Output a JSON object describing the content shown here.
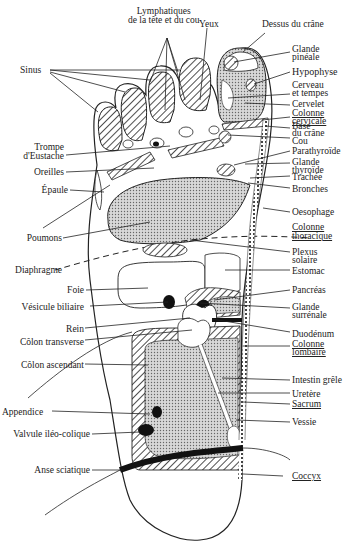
{
  "diagram": {
    "labels_top": {
      "lymphatiques": [
        "Lymphatiques",
        "de la tête et du cou"
      ],
      "yeux": "Yeux",
      "dessus_crane": "Dessus du crâne"
    },
    "labels_left": {
      "sinus": "Sinus",
      "trompe": [
        "Trompe",
        "d'Eustache"
      ],
      "oreilles": "Oreilles",
      "epaule": "Épaule",
      "poumons": "Poumons",
      "diaphragme": "Diaphragme",
      "foie": "Foie",
      "vesicule": "Vésicule biliaire",
      "rein": "Rein",
      "colon_transverse": "Côlon transverse",
      "colon_ascendant": "Côlon ascendant",
      "appendice": "Appendice",
      "valvule": "Valvule iléo-colique",
      "anse": "Anse sciatique"
    },
    "labels_right": {
      "glande_pineale": [
        "Glande",
        "pinéale"
      ],
      "hypophyse": "Hypophyse",
      "cerveau": [
        "Cerveau",
        "et tempes"
      ],
      "cervelet": "Cervelet",
      "colonne_cervicale": [
        "Colonne",
        "cervicale"
      ],
      "base_crane": [
        "Base",
        "du crâne"
      ],
      "cou": "Cou",
      "parathyroide": "Parathyroïde",
      "glande_thyroide": [
        "Glande",
        "thyroïde"
      ],
      "trachee": "Trachée",
      "bronches": "Bronches",
      "oesophage": "Oesophage",
      "colonne_thoracique": [
        "Colonne",
        "thoracique"
      ],
      "plexus": [
        "Plexus",
        "solaire"
      ],
      "estomac": "Estomac",
      "pancreas": "Pancréas",
      "glande_surrenale": [
        "Glande",
        "surrénale"
      ],
      "duodenum": "Duodénum",
      "colonne_lombaire": [
        "Colonne",
        "lombaire"
      ],
      "intestin": "Intestin grêle",
      "uretere": "Uretère",
      "sacrum": "Sacrum",
      "vessie": "Vessie",
      "coccyx": "Coccyx"
    },
    "colors": {
      "ink": "#222222",
      "stipple": "#bdbdbd",
      "background": "#ffffff"
    }
  }
}
